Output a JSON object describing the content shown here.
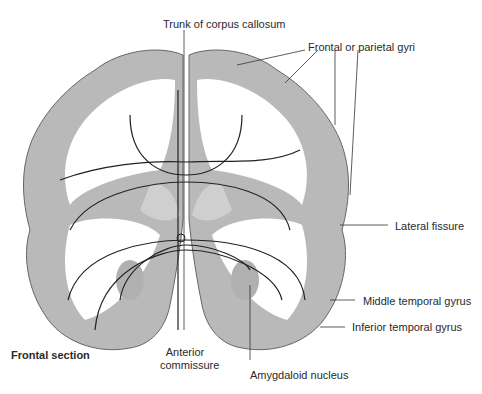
{
  "diagram": {
    "type": "anatomical-illustration",
    "colors": {
      "gray_matter": "#b8b8b8",
      "white_matter": "#ffffff",
      "outline": "#555555",
      "fibers": "#222222",
      "text": "#2a2a2a"
    }
  },
  "labels": {
    "trunk": "Trunk of corpus callosum",
    "frontal_parietal": "Frontal or parietal gyri",
    "lateral_fissure": "Lateral fissure",
    "middle_temporal": "Middle temporal gyrus",
    "inferior_temporal": "Inferior temporal gyrus",
    "frontal_section": "Frontal section",
    "anterior_commissure_1": "Anterior",
    "anterior_commissure_2": "commissure",
    "amygdaloid": "Amygdaloid nucleus"
  }
}
